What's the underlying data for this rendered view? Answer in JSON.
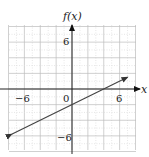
{
  "chart_data": {
    "type": "line",
    "title": "",
    "xlabel": "x",
    "ylabel": "f(x)",
    "xlim": [
      -8,
      8
    ],
    "ylim": [
      -8,
      8
    ],
    "grid": true,
    "grid_step": 2,
    "x_tick_labels": [
      "-6",
      "0",
      "6"
    ],
    "y_tick_labels": [
      "6",
      "-6"
    ],
    "series": [
      {
        "name": "f(x)",
        "equation": "f(x) = x/2 - 2",
        "slope": 0.5,
        "intercept": -2,
        "x": [
          -7.6,
          7.0
        ],
        "y": [
          -5.8,
          1.5
        ],
        "arrows_both_ends": true,
        "color": "#444444"
      }
    ]
  },
  "labels": {
    "xlabel": "x",
    "ylabel": "f(x)",
    "x_neg6": "−6",
    "x_zero": "0",
    "x_pos6": "6",
    "y_pos6": "6",
    "y_neg6": "−6"
  },
  "colors": {
    "grid": "#bbbbbb",
    "axis": "#222222",
    "line": "#444444"
  }
}
